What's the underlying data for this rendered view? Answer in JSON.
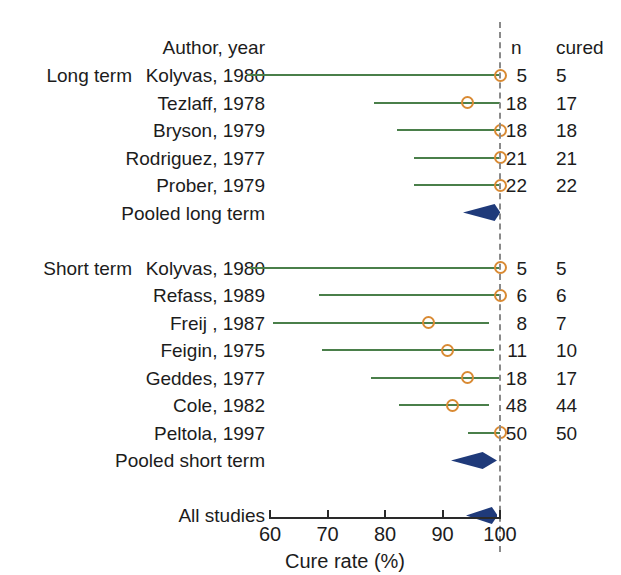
{
  "chart_data": {
    "type": "forest",
    "title": "",
    "xlabel": "Cure rate (%)",
    "ylabel": "",
    "xlim": [
      60,
      100
    ],
    "xticks": [
      60,
      70,
      80,
      90,
      100
    ],
    "xtick_labels": [
      "60",
      "70",
      "80",
      "90",
      "100"
    ],
    "grid": false,
    "reference_line": 100,
    "columns": {
      "author_header": "Author, year",
      "n_header": "n",
      "cured_header": "cured"
    },
    "groups": [
      {
        "group_label": "Long term",
        "studies": [
          {
            "label": "Kolyvas, 1980",
            "n": "5",
            "cured": "5",
            "estimate": 100.0,
            "ci_low": 56.0,
            "ci_high": 100.0
          },
          {
            "label": "Tezlaff, 1978",
            "n": "18",
            "cured": "17",
            "estimate": 94.4,
            "ci_low": 78.0,
            "ci_high": 100.0
          },
          {
            "label": "Bryson, 1979",
            "n": "18",
            "cured": "18",
            "estimate": 100.0,
            "ci_low": 82.0,
            "ci_high": 100.0
          },
          {
            "label": "Rodriguez, 1977",
            "n": "21",
            "cured": "21",
            "estimate": 100.0,
            "ci_low": 85.0,
            "ci_high": 100.0
          },
          {
            "label": "Prober, 1979",
            "n": "22",
            "cured": "22",
            "estimate": 100.0,
            "ci_low": 85.0,
            "ci_high": 100.0
          }
        ],
        "pooled": {
          "label": "Pooled long term",
          "estimate": 99.0,
          "ci_low": 93.5,
          "ci_high": 100.0
        }
      },
      {
        "group_label": "Short term",
        "studies": [
          {
            "label": "Kolyvas, 1980",
            "n": "5",
            "cured": "5",
            "estimate": 100.0,
            "ci_low": 56.5,
            "ci_high": 100.0
          },
          {
            "label": "Refass, 1989",
            "n": "6",
            "cured": "6",
            "estimate": 100.0,
            "ci_low": 68.5,
            "ci_high": 100.0
          },
          {
            "label": "Freij , 1987",
            "n": "8",
            "cured": "7",
            "estimate": 87.5,
            "ci_low": 60.5,
            "ci_high": 98.0
          },
          {
            "label": "Feigin, 1975",
            "n": "11",
            "cured": "10",
            "estimate": 90.9,
            "ci_low": 69.0,
            "ci_high": 99.0
          },
          {
            "label": "Geddes, 1977",
            "n": "18",
            "cured": "17",
            "estimate": 94.4,
            "ci_low": 77.5,
            "ci_high": 100.0
          },
          {
            "label": "Cole, 1982",
            "n": "48",
            "cured": "44",
            "estimate": 91.7,
            "ci_low": 82.5,
            "ci_high": 98.0
          },
          {
            "label": "Peltola, 1997",
            "n": "50",
            "cured": "50",
            "estimate": 100.0,
            "ci_low": 94.5,
            "ci_high": 100.0
          }
        ],
        "pooled": {
          "label": "Pooled short term",
          "estimate": 97.0,
          "ci_low": 91.5,
          "ci_high": 99.5
        }
      }
    ],
    "overall": {
      "label": "All studies",
      "estimate": 98.5,
      "ci_low": 94.0,
      "ci_high": 99.5
    },
    "colors": {
      "ci_line": "#4a7f4a",
      "marker_stroke": "#d98a33",
      "diamond": "#1f3a7a",
      "reference_line": "#8a8a8a",
      "axis": "#2a2a2a",
      "text": "#1c1c1c",
      "background": "#ffffff"
    }
  }
}
